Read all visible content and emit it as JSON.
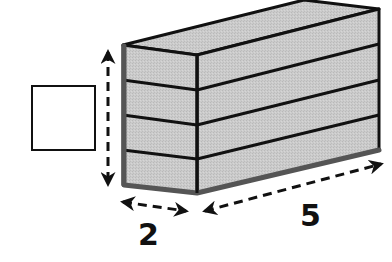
{
  "diagram": {
    "title": "",
    "colors": {
      "fill": "#c9c9c9",
      "edge": "#111111",
      "shadow_edge": "#555555",
      "answer_box_stroke": "#111111"
    },
    "prism": {
      "layers": 4,
      "dimensions": {
        "width": "2",
        "length": "5",
        "height": ""
      }
    },
    "labels": {
      "width": "2",
      "length": "5"
    },
    "answer_box": {
      "value": ""
    }
  }
}
